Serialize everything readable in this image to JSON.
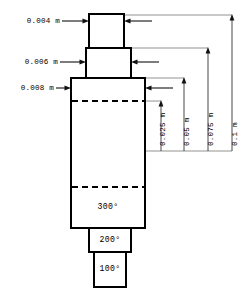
{
  "drawing": {
    "title": "stepped-cylinder-thermal-dimension-diagram",
    "units": "m",
    "stroke_color": "#000000",
    "dimension_line_color": "#666666",
    "background_color": "#ffffff"
  },
  "thickness_labels": [
    {
      "id": "top-step",
      "text": "0.004 m"
    },
    {
      "id": "second-step",
      "text": "0.006 m"
    },
    {
      "id": "main-body",
      "text": "0.008 m"
    }
  ],
  "height_labels": [
    {
      "id": "h1",
      "text": "0.025 m"
    },
    {
      "id": "h2",
      "text": "0.05 m"
    },
    {
      "id": "h3",
      "text": "0.075 m"
    },
    {
      "id": "h4",
      "text": "0.1 m"
    }
  ],
  "temperature_labels": [
    {
      "id": "t300",
      "text": "300°"
    },
    {
      "id": "t200",
      "text": "200°"
    },
    {
      "id": "t100",
      "text": "100°"
    }
  ]
}
